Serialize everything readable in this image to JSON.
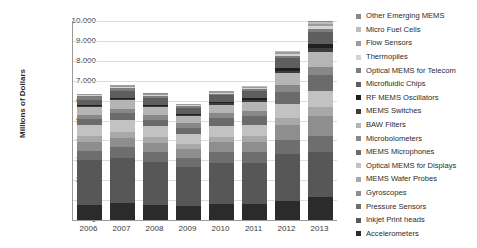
{
  "chart_data": {
    "type": "bar",
    "stacked": true,
    "title": "",
    "xlabel": "",
    "ylabel": "Millions of Dollars",
    "ylim": [
      0,
      10000
    ],
    "ytick_labels": [
      "10.000",
      "9.000",
      "8.000",
      "7.000",
      "6.000",
      "5.000",
      "4.000",
      "3.000",
      "2.000",
      "1.000",
      "0"
    ],
    "ytick_values": [
      10000,
      9000,
      8000,
      7000,
      6000,
      5000,
      4000,
      3000,
      2000,
      1000,
      0
    ],
    "grid": true,
    "legend_position": "right",
    "categories": [
      "2006",
      "2007",
      "2008",
      "2009",
      "2010",
      "2011",
      "2012",
      "2013"
    ],
    "totals": [
      6350,
      6700,
      6300,
      5750,
      6300,
      6350,
      8000,
      9000
    ],
    "series": [
      {
        "name": "Accelerometers",
        "color": "#2b2b2b",
        "values": [
          760,
          830,
          760,
          700,
          790,
          800,
          980,
          1150
        ]
      },
      {
        "name": "Inkjet Print heads",
        "color": "#575757",
        "values": [
          2240,
          2300,
          2150,
          1950,
          2100,
          2050,
          2320,
          2250
        ]
      },
      {
        "name": "Pressure Sensors",
        "color": "#6e6e6e",
        "values": [
          480,
          520,
          500,
          480,
          530,
          560,
          700,
          840
        ]
      },
      {
        "name": "Gyroscopes",
        "color": "#8e8e8e",
        "values": [
          430,
          470,
          460,
          430,
          480,
          520,
          760,
          1010
        ]
      },
      {
        "name": "MEMS Wafer Probes",
        "color": "#a8a8a8",
        "values": [
          290,
          300,
          280,
          260,
          280,
          290,
          360,
          420
        ]
      },
      {
        "name": "Optical MEMS for Displays",
        "color": "#c2c2c2",
        "values": [
          560,
          600,
          570,
          510,
          560,
          580,
          700,
          820
        ]
      },
      {
        "name": "MEMS Microphones",
        "color": "#6b6b6b",
        "values": [
          300,
          340,
          330,
          320,
          370,
          420,
          600,
          780
        ]
      },
      {
        "name": "Microbolometers",
        "color": "#888888",
        "values": [
          220,
          240,
          230,
          220,
          250,
          270,
          350,
          430
        ]
      },
      {
        "name": "BAW Filters",
        "color": "#b5b5b5",
        "values": [
          380,
          420,
          400,
          370,
          420,
          450,
          600,
          760
        ]
      },
      {
        "name": "MEMS Switches",
        "color": "#3d3d3d",
        "values": [
          60,
          70,
          70,
          65,
          80,
          90,
          130,
          180
        ]
      },
      {
        "name": "RF MEMS Oscillators",
        "color": "#1f1f1f",
        "values": [
          40,
          50,
          50,
          50,
          70,
          90,
          150,
          230
        ]
      },
      {
        "name": "Microfluidic Chips",
        "color": "#5e5e5e",
        "values": [
          300,
          330,
          320,
          300,
          340,
          370,
          480,
          600
        ]
      },
      {
        "name": "Optical MEMS for Telecom",
        "color": "#7d7d7d",
        "values": [
          160,
          170,
          100,
          60,
          70,
          80,
          110,
          140
        ]
      },
      {
        "name": "Thermopiles",
        "color": "#d4d4d4",
        "values": [
          60,
          70,
          60,
          55,
          65,
          70,
          95,
          125
        ]
      },
      {
        "name": "Flow Sensors",
        "color": "#9b9b9b",
        "values": [
          60,
          70,
          65,
          60,
          70,
          75,
          110,
          145
        ]
      },
      {
        "name": "Micro Fuel Cells",
        "color": "#bdbdbd",
        "values": [
          10,
          12,
          12,
          12,
          18,
          25,
          40,
          65
        ]
      },
      {
        "name": "Other Emerging MEMS",
        "color": "#8a8a8a",
        "values": [
          0,
          8,
          8,
          8,
          12,
          15,
          28,
          55
        ]
      }
    ],
    "legend_order_top_to_bottom": [
      "Other Emerging MEMS",
      "Micro Fuel Cells",
      "Flow Sensors",
      "Thermopiles",
      "Optical MEMS for Telecom",
      "Microfluidic Chips",
      "RF MEMS Oscillators",
      "MEMS Switches",
      "BAW Filters",
      "Microbolometers",
      "MEMS Microphones",
      "Optical MEMS for Displays",
      "MEMS Wafer Probes",
      "Gyroscopes",
      "Pressure Sensors",
      "Inkjet Print heads",
      "Accelerometers"
    ]
  },
  "colors": {
    "background": "#ffffff",
    "axis": "#9a9a9a",
    "gridline": "#dcdcdc",
    "text": "#2b2b2b"
  }
}
